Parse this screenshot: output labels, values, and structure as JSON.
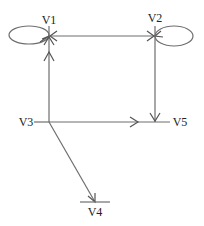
{
  "diagram": {
    "type": "directed-graph",
    "colors": {
      "line": "#6e6e6e",
      "arrow": "#555555",
      "text": "#222222",
      "background": "#ffffff"
    },
    "nodes": [
      {
        "id": "V1",
        "label": "V1",
        "x": 49,
        "y": 36
      },
      {
        "id": "V2",
        "label": "V2",
        "x": 155,
        "y": 36
      },
      {
        "id": "V3",
        "label": "V3",
        "x": 49,
        "y": 122
      },
      {
        "id": "V4",
        "label": "V4",
        "x": 95,
        "y": 202
      },
      {
        "id": "V5",
        "label": "V5",
        "x": 155,
        "y": 122
      }
    ],
    "edges": [
      {
        "from": "V1",
        "to": "V1",
        "kind": "self-loop"
      },
      {
        "from": "V2",
        "to": "V2",
        "kind": "self-loop"
      },
      {
        "from": "V1",
        "to": "V2",
        "kind": "bidirectional"
      },
      {
        "from": "V3",
        "to": "V1",
        "kind": "directed"
      },
      {
        "from": "V2",
        "to": "V5",
        "kind": "directed"
      },
      {
        "from": "V3",
        "to": "V5",
        "kind": "directed"
      },
      {
        "from": "V3",
        "to": "V4",
        "kind": "directed"
      }
    ]
  }
}
